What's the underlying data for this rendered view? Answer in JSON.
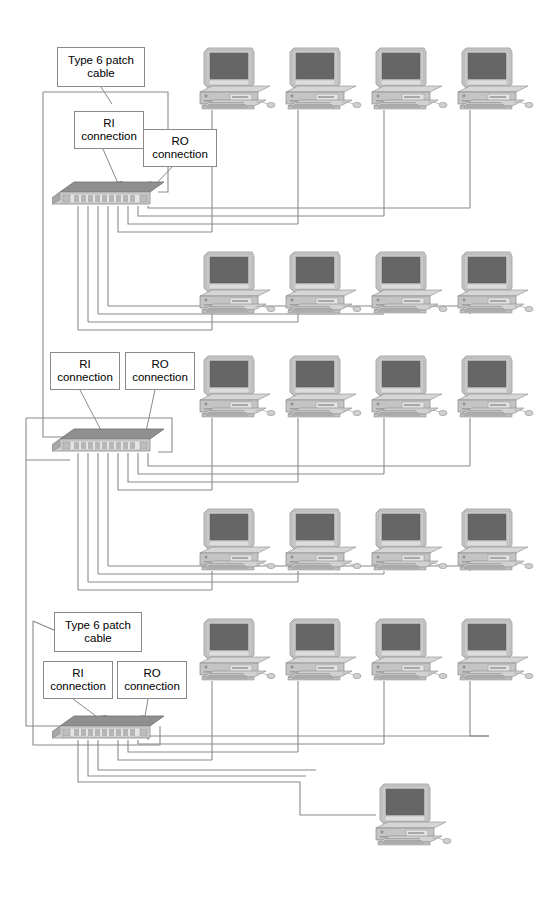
{
  "diagram": {
    "background_color": "#ffffff",
    "line_color": "#8a8a8a",
    "text_color": "#000000"
  },
  "labels": [
    {
      "id": "patch-top",
      "text": "Type 6 patch\ncable",
      "x": 57,
      "y": 47,
      "w": 88,
      "h": 40
    },
    {
      "id": "ri-top",
      "text": "RI\nconnection",
      "x": 74,
      "y": 111,
      "w": 70,
      "h": 38
    },
    {
      "id": "ro-top",
      "text": "RO\nconnection",
      "x": 143,
      "y": 129,
      "w": 74,
      "h": 38
    },
    {
      "id": "ri-mid",
      "text": "RI\nconnection",
      "x": 50,
      "y": 352,
      "w": 70,
      "h": 38
    },
    {
      "id": "ro-mid",
      "text": "RO\nconnection",
      "x": 125,
      "y": 352,
      "w": 70,
      "h": 38
    },
    {
      "id": "patch-bottom",
      "text": "Type 6 patch\ncable",
      "x": 54,
      "y": 612,
      "w": 88,
      "h": 40
    },
    {
      "id": "ri-bottom",
      "text": "RI\nconnection",
      "x": 43,
      "y": 661,
      "w": 70,
      "h": 38
    },
    {
      "id": "ro-bottom",
      "text": "RO\nconnection",
      "x": 117,
      "y": 661,
      "w": 70,
      "h": 38
    }
  ],
  "mau_units": [
    {
      "id": "mau-top",
      "name": "MAU 1",
      "x": 52,
      "y": 178,
      "w": 112,
      "h": 28,
      "ports": 10
    },
    {
      "id": "mau-middle",
      "name": "MAU 2",
      "x": 52,
      "y": 425,
      "w": 112,
      "h": 28,
      "ports": 10
    },
    {
      "id": "mau-bottom",
      "name": "MAU 3",
      "x": 52,
      "y": 712,
      "w": 112,
      "h": 28,
      "ports": 10
    }
  ],
  "computers": [
    {
      "id": "pc-r1-c1",
      "row": 1,
      "col": 1,
      "x": 196,
      "y": 44
    },
    {
      "id": "pc-r1-c2",
      "row": 1,
      "col": 2,
      "x": 282,
      "y": 44
    },
    {
      "id": "pc-r1-c3",
      "row": 1,
      "col": 3,
      "x": 368,
      "y": 44
    },
    {
      "id": "pc-r1-c4",
      "row": 1,
      "col": 4,
      "x": 454,
      "y": 44
    },
    {
      "id": "pc-r2-c1",
      "row": 2,
      "col": 1,
      "x": 196,
      "y": 248
    },
    {
      "id": "pc-r2-c2",
      "row": 2,
      "col": 2,
      "x": 282,
      "y": 248
    },
    {
      "id": "pc-r2-c3",
      "row": 2,
      "col": 3,
      "x": 368,
      "y": 248
    },
    {
      "id": "pc-r2-c4",
      "row": 2,
      "col": 4,
      "x": 454,
      "y": 248
    },
    {
      "id": "pc-r3-c1",
      "row": 3,
      "col": 1,
      "x": 196,
      "y": 352
    },
    {
      "id": "pc-r3-c2",
      "row": 3,
      "col": 2,
      "x": 282,
      "y": 352
    },
    {
      "id": "pc-r3-c3",
      "row": 3,
      "col": 3,
      "x": 368,
      "y": 352
    },
    {
      "id": "pc-r3-c4",
      "row": 3,
      "col": 4,
      "x": 454,
      "y": 352
    },
    {
      "id": "pc-r4-c1",
      "row": 4,
      "col": 1,
      "x": 196,
      "y": 505
    },
    {
      "id": "pc-r4-c2",
      "row": 4,
      "col": 2,
      "x": 282,
      "y": 505
    },
    {
      "id": "pc-r4-c3",
      "row": 4,
      "col": 3,
      "x": 368,
      "y": 505
    },
    {
      "id": "pc-r4-c4",
      "row": 4,
      "col": 4,
      "x": 454,
      "y": 505
    },
    {
      "id": "pc-r5-c1",
      "row": 5,
      "col": 1,
      "x": 196,
      "y": 615
    },
    {
      "id": "pc-r5-c2",
      "row": 5,
      "col": 2,
      "x": 282,
      "y": 615
    },
    {
      "id": "pc-r5-c3",
      "row": 5,
      "col": 3,
      "x": 368,
      "y": 615
    },
    {
      "id": "pc-r5-c4",
      "row": 5,
      "col": 4,
      "x": 454,
      "y": 615
    },
    {
      "id": "pc-last",
      "row": 6,
      "col": 1,
      "x": 372,
      "y": 780
    }
  ]
}
